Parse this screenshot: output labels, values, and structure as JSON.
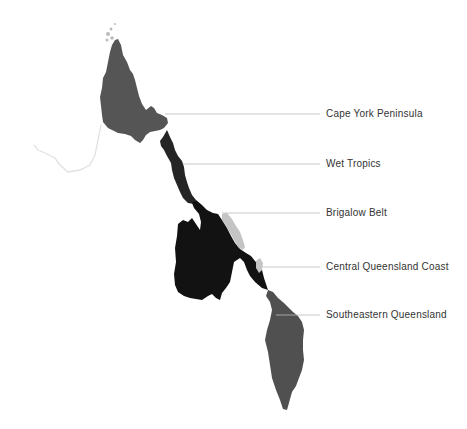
{
  "map": {
    "type": "choropleth-region-map",
    "regions": [
      {
        "name": "Cape York Peninsula",
        "color": "#555555",
        "label_y": 114,
        "leader_from_x": 165
      },
      {
        "name": "Wet Tropics",
        "color": "#252525",
        "label_y": 164,
        "leader_from_x": 183
      },
      {
        "name": "Brigalow Belt",
        "color": "#121212",
        "label_y": 213,
        "leader_from_x": 222
      },
      {
        "name": "Central Queensland Coast",
        "color": "#c4c4c4",
        "label_y": 267,
        "leader_from_x": 262
      },
      {
        "name": "Southeastern Queensland",
        "color": "#505050",
        "label_y": 315,
        "leader_from_x": 276
      }
    ],
    "leader_line_color": "#bbbbbb",
    "outline_color": "#e2e2e2"
  }
}
